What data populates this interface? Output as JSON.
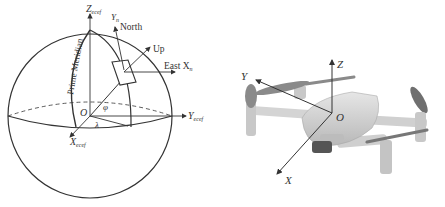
{
  "left_diagram": {
    "title": "ECEF and local ENU coordinate frames on the Earth sphere",
    "labels": {
      "z_axis": "Z",
      "z_sub": "ecef",
      "y_axis": "Y",
      "y_sub": "ecef",
      "x_axis": "X",
      "x_sub": "ecef",
      "origin": "O",
      "north_axis": "Y",
      "north_sub": "n",
      "north": "North",
      "up": "Up",
      "east": "East X",
      "east_sub": "n",
      "prime_meridian": "Prime Meridian",
      "latitude": "φ",
      "longitude": "λ"
    },
    "colors": {
      "stroke": "#333333",
      "text": "#333333"
    }
  },
  "right_diagram": {
    "title": "Drone body coordinate frame",
    "labels": {
      "x_axis": "X",
      "y_axis": "Y",
      "z_axis": "Z",
      "origin": "O"
    },
    "colors": {
      "body": "#d9d9d9",
      "body_dark": "#8a8a8a",
      "propeller": "#7a7a7a",
      "axis": "#333333"
    }
  }
}
